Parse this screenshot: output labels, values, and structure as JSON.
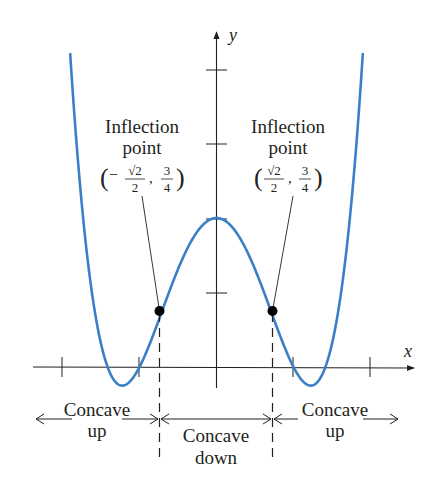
{
  "figure": {
    "type": "function-graph",
    "function": "x^4 - 3x^2 + 2",
    "curve_color": "#3a7fc8",
    "ink_color": "#231f20",
    "axes": {
      "x_label": "x",
      "y_label": "y",
      "x_ticks": [
        -2,
        -1,
        1,
        2
      ],
      "y_ticks": [
        1,
        2,
        3,
        4
      ],
      "x_range": [
        -1.9,
        1.9
      ]
    },
    "inflection_points": [
      {
        "id": "left",
        "label_line1": "Inflection",
        "label_line2": "point",
        "coords_text": "(−√2/2, 3/4)",
        "sign": "−",
        "frac_x_num": "√2",
        "frac_x_den": "2",
        "frac_y_num": "3",
        "frac_y_den": "4",
        "x": -0.7071,
        "y": 0.75
      },
      {
        "id": "right",
        "label_line1": "Inflection",
        "label_line2": "point",
        "coords_text": "(√2/2, 3/4)",
        "sign": "",
        "frac_x_num": "√2",
        "frac_x_den": "2",
        "frac_y_num": "3",
        "frac_y_den": "4",
        "x": 0.7071,
        "y": 0.75
      }
    ],
    "concavity_regions": [
      {
        "id": "left",
        "line1": "Concave",
        "line2": "up"
      },
      {
        "id": "middle",
        "line1": "Concave",
        "line2": "down"
      },
      {
        "id": "right",
        "line1": "Concave",
        "line2": "up"
      }
    ]
  }
}
